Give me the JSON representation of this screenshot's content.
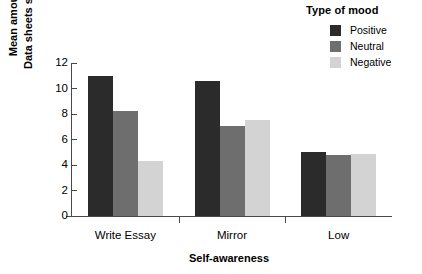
{
  "chart_data": {
    "type": "bar",
    "title": "",
    "xlabel": "Self-awareness",
    "ylabel_lines": [
      "Mean amount of",
      "Data sheets summed"
    ],
    "categories": [
      "Write Essay",
      "Mirror",
      "Low"
    ],
    "series": [
      {
        "name": "Positive",
        "color": "#2b2b2b",
        "values": [
          11.0,
          10.6,
          5.0
        ]
      },
      {
        "name": "Neutral",
        "color": "#6e6e6e",
        "values": [
          8.2,
          7.05,
          4.75
        ]
      },
      {
        "name": "Negative",
        "color": "#d3d3d3",
        "values": [
          4.3,
          7.5,
          4.9
        ]
      }
    ],
    "ylim": [
      0,
      12
    ],
    "yticks": [
      0,
      2,
      4,
      6,
      8,
      10,
      12
    ],
    "ytick_labels": [
      "0",
      "2",
      "4",
      "6",
      "8",
      "10",
      "12"
    ],
    "grid": false,
    "legend": {
      "title": "Type of mood",
      "position": "top-right",
      "entries": [
        "Positive",
        "Neutral",
        "Negative"
      ]
    },
    "axis_color": "#4a4a4a"
  }
}
